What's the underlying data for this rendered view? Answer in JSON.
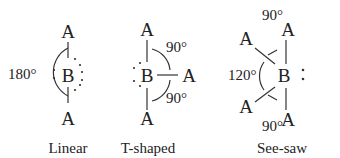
{
  "diagram": {
    "colors": {
      "text": "#222222",
      "line": "#333333",
      "background": "#ffffff"
    },
    "geometries": [
      {
        "name": "Linear",
        "central_atom": "B",
        "ligand_label": "A",
        "ligands": [
          "A",
          "A"
        ],
        "lone_pairs": 3,
        "angles": [
          "180°"
        ]
      },
      {
        "name": "T-shaped",
        "central_atom": "B",
        "ligand_label": "A",
        "ligands": [
          "A",
          "A",
          "A"
        ],
        "lone_pairs": 2,
        "angles": [
          "90°",
          "90°"
        ]
      },
      {
        "name": "See-saw",
        "central_atom": "B",
        "ligand_label": "A",
        "ligands": [
          "A",
          "A",
          "A",
          "A"
        ],
        "lone_pairs": 1,
        "angles": [
          "90°",
          "120°",
          "90°"
        ]
      }
    ]
  }
}
